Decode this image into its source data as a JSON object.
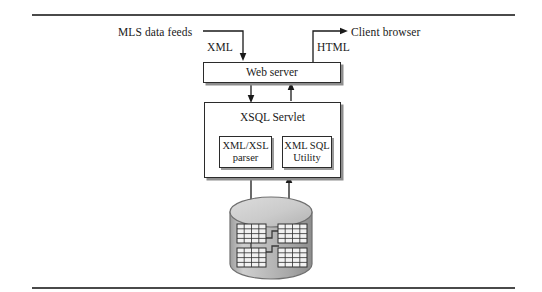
{
  "diagram": {
    "type": "architecture-flow",
    "background_color": "#ffffff",
    "line_color": "#2b2b2b",
    "shadow_color": "#8e8e8e"
  },
  "labels": {
    "mls_feeds": "MLS data feeds",
    "xml": "XML",
    "html": "HTML",
    "client_browser": "Client browser"
  },
  "nodes": {
    "web_server": "Web server",
    "xsql_servlet": "XSQL Servlet",
    "xml_xsl_parser": "XML/XSL\nparser",
    "xml_xsl_parser_line1": "XML/XSL",
    "xml_xsl_parser_line2": "parser",
    "xml_sql_utility_line1": "XML SQL",
    "xml_sql_utility_line2": "Utility",
    "database": "database"
  },
  "edges": [
    {
      "from": "MLS data feeds",
      "to": "Web server",
      "label": "XML",
      "direction": "down"
    },
    {
      "from": "Web server",
      "to": "Client browser",
      "label": "HTML",
      "direction": "right"
    },
    {
      "from": "Web server",
      "to": "XSQL Servlet",
      "label": "",
      "direction": "down"
    },
    {
      "from": "XSQL Servlet",
      "to": "Web server",
      "label": "",
      "direction": "up"
    },
    {
      "from": "XSQL Servlet",
      "to": "database",
      "label": "",
      "direction": "down"
    },
    {
      "from": "database",
      "to": "XSQL Servlet",
      "label": "",
      "direction": "up"
    }
  ],
  "database_glyph": {
    "table_count": 4,
    "arrangement": "2x2",
    "body_color": "#b5b5b5",
    "top_color": "#d2d2d2"
  }
}
